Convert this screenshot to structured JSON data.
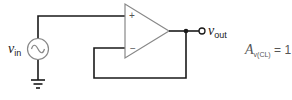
{
  "diagram": {
    "input_label": {
      "symbol": "v",
      "subscript": "in"
    },
    "output_label": {
      "symbol": "v",
      "subscript": "out"
    },
    "opamp": {
      "plus": "+",
      "minus": "−"
    },
    "gain_equation": {
      "symbol": "A",
      "subscript": "v(CL)",
      "equals": "=",
      "value": "1"
    },
    "colors": {
      "wire": "#1a1a1a",
      "component": "#888888",
      "text": "#1a1a1a",
      "gain_text": "#555555"
    }
  }
}
